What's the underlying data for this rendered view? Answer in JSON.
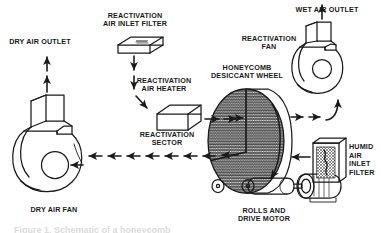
{
  "figure": {
    "caption_partial": "Figure 1. Schematic of a honeycomb",
    "stroke_color": "#1a1a1a",
    "text_color": "#1a1a1a",
    "background": "#ffffff"
  },
  "labels": {
    "dry_air_outlet": "DRY AIR OUTLET",
    "reactivation_air_inlet_filter_l1": "REACTIVATION",
    "reactivation_air_inlet_filter_l2": "AIR INLET FILTER",
    "reactivation_air_heater_l1": "REACTIVATION",
    "reactivation_air_heater_l2": "AIR HEATER",
    "honeycomb_desiccant_wheel_l1": "HONEYCOMB",
    "honeycomb_desiccant_wheel_l2": "DESICCANT WHEEL",
    "wet_air_outlet": "WET AIR OUTLET",
    "reactivation_fan_l1": "REACTIVATION",
    "reactivation_fan_l2": "FAN",
    "reactivation_sector_l1": "REACTIVATION",
    "reactivation_sector_l2": "SECTOR",
    "dry_air_fan": "DRY AIR FAN",
    "rolls_and_drive_motor_l1": "ROLLS AND",
    "rolls_and_drive_motor_l2": "DRIVE MOTOR",
    "humid_air_inlet_filter_l1": "HUMID",
    "humid_air_inlet_filter_l2": "AIR",
    "humid_air_inlet_filter_l3": "INLET",
    "humid_air_inlet_filter_l4": "FILTER"
  },
  "components": [
    {
      "id": "dry-air-fan",
      "type": "centrifugal-blower",
      "label": "DRY AIR FAN"
    },
    {
      "id": "reactivation-fan",
      "type": "centrifugal-blower",
      "label": "REACTIVATION FAN"
    },
    {
      "id": "reactivation-air-inlet-filter",
      "type": "flat-panel-filter",
      "label": "REACTIVATION AIR INLET FILTER"
    },
    {
      "id": "reactivation-air-heater",
      "type": "box-heater",
      "label": "REACTIVATION AIR HEATER"
    },
    {
      "id": "honeycomb-desiccant-wheel",
      "type": "rotating-wheel",
      "label": "HONEYCOMB DESICCANT WHEEL"
    },
    {
      "id": "reactivation-sector",
      "type": "wheel-sector",
      "label": "REACTIVATION SECTOR"
    },
    {
      "id": "humid-air-inlet-filter",
      "type": "panel-filter",
      "label": "HUMID AIR INLET FILTER"
    },
    {
      "id": "rolls-and-drive-motor",
      "type": "roller-drive",
      "label": "ROLLS AND DRIVE MOTOR"
    }
  ],
  "flows": [
    {
      "id": "dry-air-outlet-flow",
      "direction": "up",
      "label": "DRY AIR OUTLET"
    },
    {
      "id": "reactivation-inlet-flow",
      "direction": "down",
      "label": "reactivation air in"
    },
    {
      "id": "process-air-flow",
      "direction": "left",
      "label": "process air to dry air fan"
    },
    {
      "id": "reactivation-air-flow",
      "direction": "right",
      "label": "reactivation air to fan"
    },
    {
      "id": "humid-air-inlet-flow",
      "direction": "left",
      "label": "humid air inlet"
    },
    {
      "id": "wheel-rotation",
      "direction": "clockwise",
      "label": "wheel rotation"
    },
    {
      "id": "wet-air-outlet-flow",
      "direction": "up",
      "label": "WET AIR OUTLET"
    }
  ]
}
